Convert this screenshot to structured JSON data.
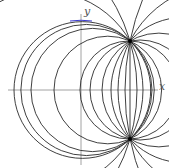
{
  "figure": {
    "axes": {
      "x_label": "x",
      "y_label": "y"
    },
    "origin_px": [
      81,
      90
    ],
    "common_points_px": [
      [
        130,
        41
      ],
      [
        130,
        139
      ]
    ],
    "left_crossings_px": [
      14,
      31,
      54,
      80,
      90,
      102,
      111,
      118,
      125
    ],
    "chord_x_px": 130,
    "highlight_color": "#3a3ad0",
    "stroke_color": "#2a2a2a",
    "axis_color": "#8a8a8a"
  }
}
